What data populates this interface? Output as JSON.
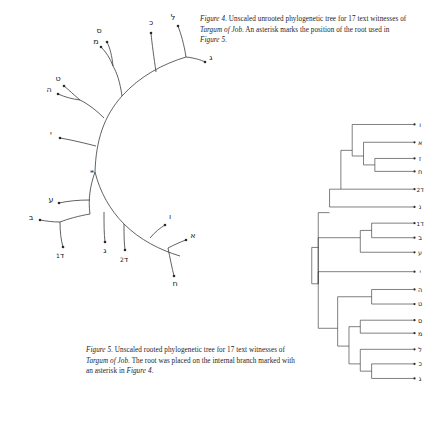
{
  "figure4": {
    "caption_prefix": "Figure 4",
    "caption_text_1": ". Unscaled unrooted phylogenetic tree for 17 text witnesses of ",
    "caption_work": "Targum of Job",
    "caption_text_2": ". An asterisk marks the position of the root used in ",
    "caption_xref": "Figure 5",
    "caption_end": ".",
    "root_marker": "*",
    "tips": [
      {
        "label": "כ",
        "name": "kaf"
      },
      {
        "label": "ל",
        "name": "lamed"
      },
      {
        "label": "מ",
        "name": "mem"
      },
      {
        "label": "ס",
        "name": "samekh"
      },
      {
        "label": "ט",
        "name": "tet"
      },
      {
        "label": "ה",
        "name": "he"
      },
      {
        "label": "י",
        "name": "yod"
      },
      {
        "label": "ע",
        "name": "ayin"
      },
      {
        "label": "ב",
        "name": "bet"
      },
      {
        "label": "ד",
        "sub": "1",
        "name": "dalet-1"
      },
      {
        "label": "ג",
        "name": "gimel"
      },
      {
        "label": "ד",
        "sub": "2",
        "name": "dalet-2"
      },
      {
        "label": "ו",
        "name": "vav"
      },
      {
        "label": "א",
        "name": "alef"
      },
      {
        "label": "ח",
        "name": "chet"
      },
      {
        "label": "ז",
        "name": "zayin"
      },
      {
        "label": "ג",
        "name": "gimel-right"
      }
    ]
  },
  "figure5": {
    "caption_prefix": "Figure 5",
    "caption_text_1": ". Unscaled rooted phylogenetic tree for 17 text witnesses of ",
    "caption_work": "Targum of Job",
    "caption_text_2": ". The root was placed on the internal branch marked with an asterisk in ",
    "caption_xref": "Figure 4",
    "caption_end": ".",
    "tips": [
      {
        "label": "ו",
        "name": "vav",
        "y": 8
      },
      {
        "label": "א",
        "name": "alef",
        "y": 30
      },
      {
        "label": "ז",
        "name": "zayin",
        "y": 50
      },
      {
        "label": "ח",
        "name": "chet",
        "y": 66
      },
      {
        "label": "ד",
        "sub": "2",
        "name": "dalet-2",
        "y": 88
      },
      {
        "label": "נ",
        "name": "nun",
        "y": 110
      },
      {
        "label": "ד",
        "sub": "1",
        "name": "dalet-1",
        "y": 130
      },
      {
        "label": "ב",
        "name": "bet",
        "y": 148
      },
      {
        "label": "ע",
        "name": "ayin",
        "y": 166
      },
      {
        "label": "י",
        "name": "yod",
        "y": 190
      },
      {
        "label": "ה",
        "name": "he",
        "y": 212
      },
      {
        "label": "ט",
        "name": "tet",
        "y": 230
      },
      {
        "label": "ס",
        "name": "samekh",
        "y": 250
      },
      {
        "label": "מ",
        "name": "mem",
        "y": 266
      },
      {
        "label": "ל",
        "name": "lamed",
        "y": 286
      },
      {
        "label": "כ",
        "name": "kaf",
        "y": 304
      },
      {
        "label": "ג",
        "name": "gimel",
        "y": 322
      }
    ]
  },
  "colors": {
    "line": "#3a3a3a",
    "text": "#26231f",
    "background": "#ffffff"
  }
}
